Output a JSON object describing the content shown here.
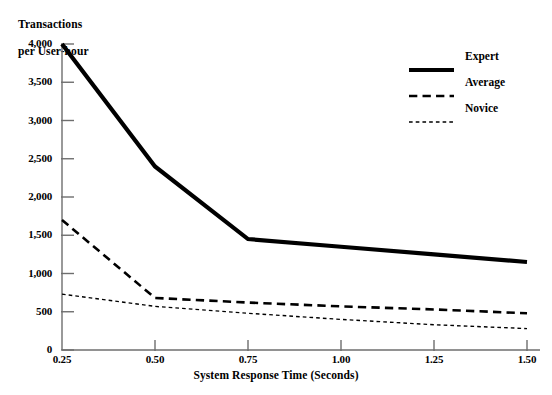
{
  "chart_data": {
    "type": "line",
    "title": "Transactions per User-hour",
    "xlabel": "System Response Time (Seconds)",
    "ylabel": "Transactions per User-hour",
    "x": [
      0.25,
      0.5,
      0.75,
      1.0,
      1.25,
      1.5
    ],
    "xtick_labels": [
      "0.25",
      "0.50",
      "0.75",
      "1.00",
      "1.25",
      "1.50"
    ],
    "ytick_values": [
      0,
      500,
      1000,
      1500,
      2000,
      2500,
      3000,
      3500,
      4000
    ],
    "ytick_labels": [
      "0",
      "500",
      "1,000",
      "1,500",
      "2,000",
      "2,500",
      "3,000",
      "3,500",
      "4,000"
    ],
    "xlim": [
      0.25,
      1.5
    ],
    "ylim": [
      0,
      4000
    ],
    "grid": false,
    "legend_position": "upper right",
    "series": [
      {
        "name": "Expert",
        "style": "solid",
        "color": "#000000",
        "width": 4.2,
        "values": [
          4000,
          2400,
          1450,
          1350,
          1250,
          1150
        ]
      },
      {
        "name": "Average",
        "style": "dashed",
        "color": "#000000",
        "width": 2.6,
        "values": [
          1700,
          680,
          620,
          570,
          530,
          480
        ]
      },
      {
        "name": "Novice",
        "style": "dotted",
        "color": "#000000",
        "width": 1.4,
        "values": [
          730,
          570,
          480,
          400,
          330,
          280
        ]
      }
    ]
  },
  "axis": {
    "y_title_line1": "Transactions",
    "y_title_line2": "per User-hour",
    "x_title": "System Response Time (Seconds)"
  },
  "legend": {
    "items": [
      {
        "label": "Expert"
      },
      {
        "label": "Average"
      },
      {
        "label": "Novice"
      }
    ]
  },
  "caption": {
    "text": ""
  },
  "colors": {
    "axis": "#6e6e6e",
    "ink": "#000000",
    "background": "#ffffff"
  }
}
